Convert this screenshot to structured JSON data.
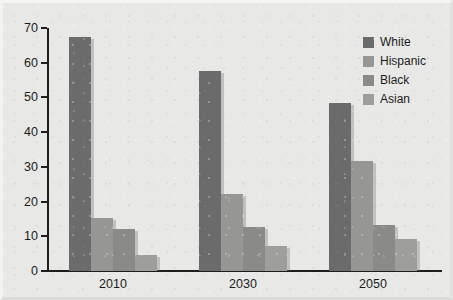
{
  "chart_data": {
    "type": "bar",
    "title": "",
    "subtitle": "",
    "xlabel": "",
    "ylabel": "",
    "categories": [
      "2010",
      "2030",
      "2050"
    ],
    "series": [
      {
        "name": "White",
        "values": [
          67.5,
          57.6,
          48.3
        ],
        "color": "#6b6b6b"
      },
      {
        "name": "Hispanic",
        "values": [
          15.3,
          22.3,
          31.7
        ],
        "color": "#969694"
      },
      {
        "name": "Black",
        "values": [
          12.2,
          12.7,
          13.2
        ],
        "color": "#8a8a88"
      },
      {
        "name": "Asian",
        "values": [
          4.7,
          7.2,
          9.2
        ],
        "color": "#9e9e9c"
      }
    ],
    "ylim": [
      0,
      70
    ],
    "yticks": [
      0,
      10,
      20,
      30,
      40,
      50,
      60,
      70
    ],
    "ytick_labels": [
      "0",
      "10",
      "20",
      "30",
      "40",
      "50",
      "60",
      "70"
    ],
    "grid": false,
    "legend_position": "top-right",
    "legend_entries": [
      "White",
      "Hispanic",
      "Black",
      "Asian"
    ],
    "background_color": "#e8e8e6",
    "axis_color": "#1d1d1d"
  }
}
